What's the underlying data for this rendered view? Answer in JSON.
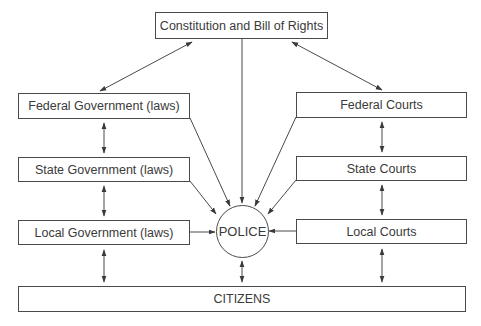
{
  "diagram": {
    "nodes": {
      "constitution": {
        "label": "Constitution and Bill of Rights"
      },
      "federal_government": {
        "label": "Federal Government (laws)"
      },
      "state_government": {
        "label": "State Government (laws)"
      },
      "local_government": {
        "label": "Local Government (laws)"
      },
      "federal_courts": {
        "label": "Federal Courts"
      },
      "state_courts": {
        "label": "State Courts"
      },
      "local_courts": {
        "label": "Local Courts"
      },
      "police": {
        "label": "POLICE"
      },
      "citizens": {
        "label": "CITIZENS"
      }
    },
    "edges": [
      {
        "from": "constitution",
        "to": "federal_government",
        "direction": "both"
      },
      {
        "from": "constitution",
        "to": "federal_courts",
        "direction": "both"
      },
      {
        "from": "constitution",
        "to": "police",
        "direction": "forward"
      },
      {
        "from": "federal_government",
        "to": "state_government",
        "direction": "both"
      },
      {
        "from": "state_government",
        "to": "local_government",
        "direction": "both"
      },
      {
        "from": "local_government",
        "to": "citizens",
        "direction": "both"
      },
      {
        "from": "federal_courts",
        "to": "state_courts",
        "direction": "both"
      },
      {
        "from": "state_courts",
        "to": "local_courts",
        "direction": "both"
      },
      {
        "from": "local_courts",
        "to": "citizens",
        "direction": "both"
      },
      {
        "from": "federal_government",
        "to": "police",
        "direction": "forward"
      },
      {
        "from": "state_government",
        "to": "police",
        "direction": "forward"
      },
      {
        "from": "local_government",
        "to": "police",
        "direction": "forward"
      },
      {
        "from": "federal_courts",
        "to": "police",
        "direction": "forward"
      },
      {
        "from": "state_courts",
        "to": "police",
        "direction": "forward"
      },
      {
        "from": "local_courts",
        "to": "police",
        "direction": "forward"
      },
      {
        "from": "police",
        "to": "citizens",
        "direction": "both"
      }
    ],
    "colors": {
      "line": "#4a4a4a",
      "text": "#3a3a3a",
      "background": "#ffffff"
    }
  }
}
